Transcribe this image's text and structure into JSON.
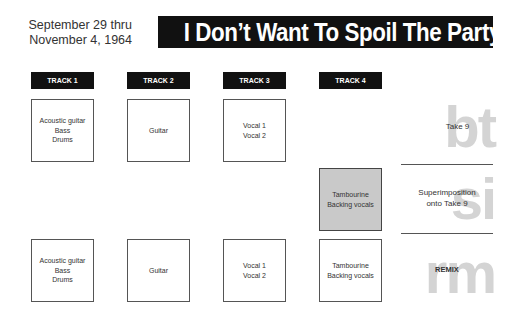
{
  "header": {
    "date_line1": "September 29 thru",
    "date_line2": "November 4, 1964",
    "title": "I Don’t Want To Spoil The Party"
  },
  "tracks": [
    {
      "label": "TRACK 1"
    },
    {
      "label": "TRACK 2"
    },
    {
      "label": "TRACK 3"
    },
    {
      "label": "TRACK 4"
    }
  ],
  "rows": {
    "take": {
      "cells": [
        {
          "lines": [
            "Acoustic guitar",
            "Bass",
            "Drums"
          ]
        },
        {
          "lines": [
            "Guitar"
          ]
        },
        {
          "lines": [
            "Vocal 1",
            "Vocal 2"
          ]
        }
      ],
      "side_letters": "bt",
      "side_label": "Take 9"
    },
    "superimposition": {
      "cells": [
        {
          "lines": [
            "Tambourine",
            "Backing vocals"
          ],
          "highlight": true
        }
      ],
      "side_letters": "si",
      "side_label_line1": "Superimposition",
      "side_label_line2": "onto Take 9"
    },
    "remix": {
      "cells": [
        {
          "lines": [
            "Acoustic guitar",
            "Bass",
            "Drums"
          ]
        },
        {
          "lines": [
            "Guitar"
          ]
        },
        {
          "lines": [
            "Vocal 1",
            "Vocal 2"
          ]
        },
        {
          "lines": [
            "Tambourine",
            "Backing vocals"
          ]
        }
      ],
      "side_letters": "rm",
      "side_label": "REMIX"
    }
  },
  "colors": {
    "header_bg": "#111111",
    "highlight_box": "#c9c9c9",
    "ghost_letters": "#d4d4d4"
  }
}
